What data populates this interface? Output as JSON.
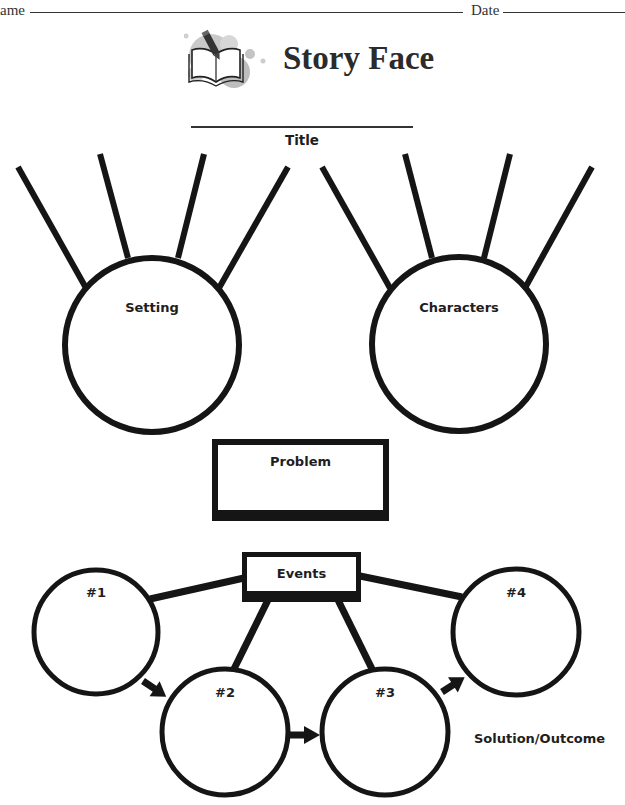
{
  "header": {
    "name_label": "ame",
    "date_label": "Date"
  },
  "logo": {
    "icon": "book-pencil-icon",
    "title": "Story Face"
  },
  "title_field": {
    "label": "Title"
  },
  "story_elements": {
    "setting": {
      "label": "Setting",
      "detail_lines": 4
    },
    "characters": {
      "label": "Characters",
      "detail_lines": 4
    }
  },
  "problem": {
    "label": "Problem"
  },
  "events": {
    "label": "Events",
    "items": [
      {
        "label": "#1"
      },
      {
        "label": "#2"
      },
      {
        "label": "#3"
      },
      {
        "label": "#4"
      }
    ],
    "outcome_label": "Solution/Outcome"
  },
  "colors": {
    "ink": "#151515",
    "logo_gray": "#b8b8b8"
  }
}
